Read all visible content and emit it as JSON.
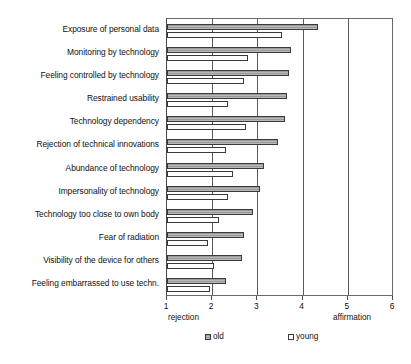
{
  "chart_data": {
    "type": "bar",
    "orientation": "horizontal",
    "title": "",
    "subtitle": "",
    "xlabel": "",
    "ylabel": "",
    "xlim": [
      1,
      6
    ],
    "ylim": null,
    "grid": true,
    "grid_axis": "x",
    "legend_position": "bottom",
    "xticks": [
      1,
      2,
      3,
      4,
      5,
      6
    ],
    "xtick_labels": [
      "1",
      "2",
      "3",
      "4",
      "5",
      "6"
    ],
    "scale_anchor_low": "rejection",
    "scale_anchor_high": "affirmation",
    "categories": [
      "Exposure of personal data",
      "Monitoring by technology",
      "Feeling controlled by technology",
      "Restrained usability",
      "Technology dependency",
      "Rejection of technical innovations",
      "Abundance of technology",
      "Impersonality of technology",
      "Technology too close to own body",
      "Fear of radiation",
      "Visibility of the device for others",
      "Feeling embarrassed to use techn."
    ],
    "series": [
      {
        "name": "old",
        "color": "#9a9a9a",
        "values": [
          4.35,
          3.75,
          3.7,
          3.65,
          3.6,
          3.45,
          3.15,
          3.05,
          2.9,
          2.7,
          2.65,
          2.3
        ]
      },
      {
        "name": "young",
        "color": "#ffffff",
        "values": [
          3.55,
          2.8,
          2.7,
          2.35,
          2.75,
          2.3,
          2.45,
          2.35,
          2.15,
          1.9,
          2.05,
          1.95
        ]
      }
    ]
  },
  "legend": {
    "entries": [
      {
        "label": "old"
      },
      {
        "label": "young"
      }
    ]
  },
  "axis": {
    "low_anchor": "rejection",
    "high_anchor": "affirmation"
  }
}
